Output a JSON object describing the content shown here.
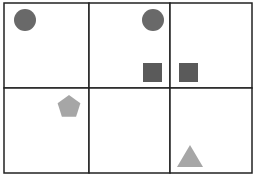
{
  "grid": {
    "rows": 2,
    "cols": 3,
    "line_color": "#222222",
    "x_lines": [
      4,
      89,
      170,
      252
    ],
    "y_lines": [
      3,
      88,
      173
    ]
  },
  "shapes": [
    {
      "type": "circle",
      "cell": [
        0,
        0
      ],
      "cx": 25,
      "cy": 20,
      "r": 11,
      "color": "#696969"
    },
    {
      "type": "circle",
      "cell": [
        0,
        1
      ],
      "cx": 153,
      "cy": 20,
      "r": 11,
      "color": "#696969"
    },
    {
      "type": "square",
      "cell": [
        0,
        1
      ],
      "x": 143,
      "y": 63,
      "w": 19,
      "h": 19,
      "color": "#5a5a5a"
    },
    {
      "type": "square",
      "cell": [
        0,
        2
      ],
      "x": 179,
      "y": 63,
      "w": 19,
      "h": 19,
      "color": "#5a5a5a"
    },
    {
      "type": "pentagon",
      "cell": [
        1,
        0
      ],
      "cx": 69,
      "cy": 107,
      "r": 12,
      "color": "#a6a6a6"
    },
    {
      "type": "triangle",
      "cell": [
        1,
        2
      ],
      "cx": 190,
      "base_y": 167,
      "top_y": 145,
      "half_w": 13,
      "color": "#a6a6a6"
    }
  ]
}
